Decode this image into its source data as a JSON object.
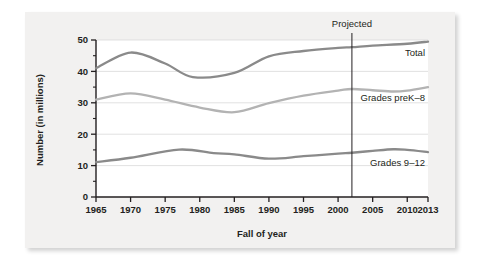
{
  "figure": {
    "background_color": "#f2f1f0",
    "plot_background_color": "#ffffff"
  },
  "chart_data": {
    "type": "line",
    "title": "",
    "xlabel": "Fall of year",
    "ylabel": "Number (in millions)",
    "xlim": [
      1965,
      2013
    ],
    "ylim": [
      0,
      50
    ],
    "grid": true,
    "grid_axis": "y",
    "legend_position": "inline-right-of-line",
    "xticks": [
      "1965",
      "1970",
      "1975",
      "1980",
      "1985",
      "1990",
      "1995",
      "2000",
      "2005",
      "2010",
      "2013"
    ],
    "xtick_values": [
      1965,
      1970,
      1975,
      1980,
      1985,
      1990,
      1995,
      2000,
      2005,
      2010,
      2013
    ],
    "yticks": [
      "0",
      "10",
      "20",
      "30",
      "40",
      "50"
    ],
    "ytick_values": [
      0,
      10,
      20,
      30,
      40,
      50
    ],
    "yminor_tick_values": [
      5,
      15,
      25,
      35,
      45
    ],
    "annotations": [
      {
        "text": "Projected",
        "x": 2002,
        "kind": "vertical-rule-label"
      }
    ],
    "series": [
      {
        "name": "Total",
        "label": "Total",
        "color": "#8a8a8a",
        "x": [
          1965,
          1970,
          1975,
          1979,
          1985,
          1990,
          1995,
          2000,
          2002,
          2005,
          2010,
          2013
        ],
        "values": [
          41.0,
          46.0,
          42.5,
          38.2,
          39.5,
          44.8,
          46.5,
          47.5,
          47.7,
          48.2,
          48.8,
          49.5
        ]
      },
      {
        "name": "Grades preK-8",
        "label": "Grades preK–8",
        "color": "#b3b3b3",
        "x": [
          1965,
          1970,
          1975,
          1980,
          1985,
          1990,
          1995,
          2000,
          2002,
          2005,
          2008,
          2010,
          2013
        ],
        "values": [
          31.0,
          33.0,
          31.0,
          28.5,
          27.0,
          29.9,
          32.3,
          33.9,
          34.4,
          34.0,
          33.6,
          33.9,
          35.0
        ]
      },
      {
        "name": "Grades 9-12",
        "label": "Grades 9–12",
        "color": "#8a8a8a",
        "x": [
          1965,
          1970,
          1977,
          1982,
          1985,
          1990,
          1995,
          2000,
          2002,
          2005,
          2008,
          2010,
          2013
        ],
        "values": [
          11.1,
          12.5,
          15.1,
          14.0,
          13.6,
          12.2,
          13.0,
          13.8,
          14.1,
          14.7,
          15.2,
          15.0,
          14.3
        ]
      }
    ]
  }
}
